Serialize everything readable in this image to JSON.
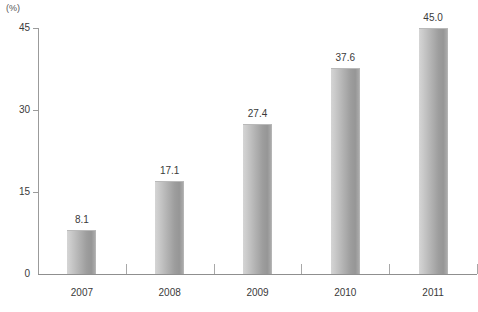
{
  "chart_data": {
    "type": "bar",
    "title": "",
    "subtitle": "",
    "unit_label": "(%)",
    "xlabel": "",
    "ylabel": "",
    "categories": [
      "2007",
      "2008",
      "2009",
      "2010",
      "2011"
    ],
    "values": [
      8.1,
      17.1,
      27.4,
      37.6,
      45.0
    ],
    "value_labels": [
      "8.1",
      "17.1",
      "27.4",
      "37.6",
      "45.0"
    ],
    "series": [
      {
        "name": "",
        "values": [
          8.1,
          17.1,
          27.4,
          37.6,
          45.0
        ]
      }
    ],
    "ylim": [
      0,
      45
    ],
    "yticks": [
      0,
      15,
      30,
      45
    ],
    "ytick_labels": [
      "0",
      "15",
      "30",
      "45"
    ],
    "grid": false,
    "legend": false,
    "legend_position": "none",
    "bar_color_light": "#d5d5d5",
    "bar_color_dark": "#969696",
    "axis_color": "#9b9b9b",
    "text_color": "#3a3a3a"
  }
}
